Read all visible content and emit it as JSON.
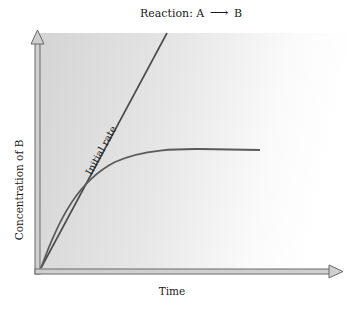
{
  "diagram": {
    "title": "Reaction: A ⟶ B",
    "title_parts": {
      "prefix": "Reaction: A",
      "arrow": "⟶",
      "suffix": "B"
    },
    "x_axis_label": "Time",
    "y_axis_label": "Concentration of B",
    "tangent_label": "Initial rate",
    "colors": {
      "shade_left": "#d6d6d6",
      "shade_right": "#ffffff",
      "axis_stroke": "#6a6a6a",
      "axis_fill": "#c9c9c9",
      "line": "#4a4a4a",
      "curve": "#5a5a5a"
    },
    "elements": [
      {
        "type": "axis",
        "name": "y-axis",
        "direction": "up"
      },
      {
        "type": "axis",
        "name": "x-axis",
        "direction": "right"
      },
      {
        "type": "line",
        "name": "initial-rate-tangent",
        "description": "Straight line from origin showing initial rate"
      },
      {
        "type": "curve",
        "name": "concentration-curve",
        "description": "Concentration of B rising then leveling off over time"
      }
    ]
  }
}
